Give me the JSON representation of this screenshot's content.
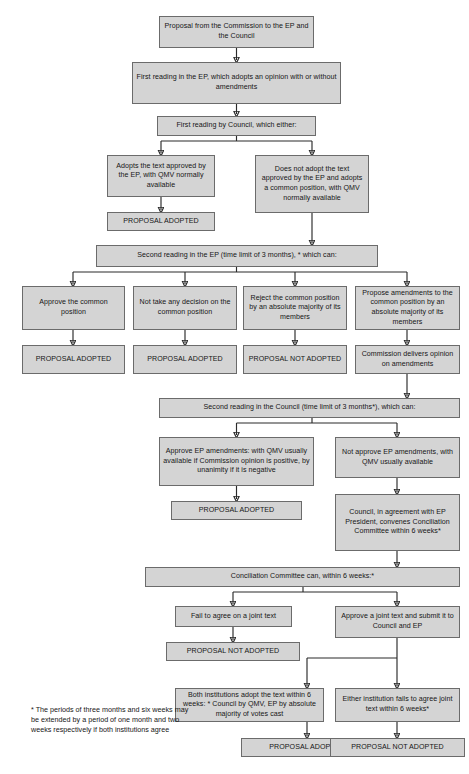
{
  "diagram": {
    "colors": {
      "node_fill": "#d4d4d4",
      "node_border": "#6b6b6b",
      "connector": "#2a2a2a",
      "text": "#161616",
      "page_background": "#ffffff"
    },
    "nodes": [
      {
        "id": "n1",
        "label": "Proposal from the Commission to the EP and the Council"
      },
      {
        "id": "n2",
        "label": "First reading in the EP, which adopts an opinion with or without amendments"
      },
      {
        "id": "n3",
        "label": "First reading by Council, which either:"
      },
      {
        "id": "n4",
        "label": "Adopts the text approved by the EP, with QMV normally available"
      },
      {
        "id": "n5",
        "label": "PROPOSAL ADOPTED"
      },
      {
        "id": "n6",
        "label": "Does not adopt the text approved by the EP and adopts a common position, with QMV normally available"
      },
      {
        "id": "n7",
        "label": "Second reading in the EP (time limit of 3 months), * which can:"
      },
      {
        "id": "n8",
        "label": "Approve the common position"
      },
      {
        "id": "n9",
        "label": "Not take any decision on the common position"
      },
      {
        "id": "n10",
        "label": "Reject the common position by an absolute majority of its members"
      },
      {
        "id": "n11",
        "label": "Propose amendments to the common position by an absolute majority of its members"
      },
      {
        "id": "n12",
        "label": "PROPOSAL ADOPTED"
      },
      {
        "id": "n13",
        "label": "PROPOSAL ADOPTED"
      },
      {
        "id": "n14",
        "label": "PROPOSAL NOT ADOPTED"
      },
      {
        "id": "n15",
        "label": "Commission delivers opinion on amendments"
      },
      {
        "id": "n16",
        "label": "Second reading in the Council (time limit of 3 months*), which can:"
      },
      {
        "id": "n17",
        "label": "Approve EP amendments: with QMV usually available if Commission opinion is positive, by unanimity if it is negative"
      },
      {
        "id": "n18",
        "label": "Not approve EP amendments, with QMV usually available"
      },
      {
        "id": "n19",
        "label": "PROPOSAL ADOPTED"
      },
      {
        "id": "n20",
        "label": "Council, in agreement with EP President, convenes Conciliation Committee within 6 weeks*"
      },
      {
        "id": "n21",
        "label": "Conciliation Committee can, within 6 weeks:*"
      },
      {
        "id": "n22",
        "label": "Fail to agree on a joint text"
      },
      {
        "id": "n23",
        "label": "Approve a joint text and submit it to Council and EP"
      },
      {
        "id": "n24",
        "label": "PROPOSAL NOT ADOPTED"
      },
      {
        "id": "n25",
        "label": "Both institutions adopt the text within 6 weeks: * Council by QMV, EP by absolute majority of votes cast"
      },
      {
        "id": "n26",
        "label": "Either institution fails to agree joint text within 6 weeks*"
      },
      {
        "id": "n27",
        "label": "PROPOSAL ADOPTED"
      },
      {
        "id": "n28",
        "label": "PROPOSAL NOT ADOPTED"
      }
    ],
    "footnote": "* The periods of three months and six weeks may be extended by a period of one month and two weeks respectively if both institutions agree",
    "caption": ""
  }
}
